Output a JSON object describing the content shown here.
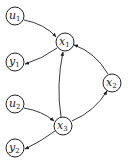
{
  "diagram": {
    "nodes": [
      {
        "id": "u1",
        "label": "u",
        "sub": "1",
        "x": 15,
        "y": 16
      },
      {
        "id": "x1",
        "label": "x",
        "sub": "1",
        "x": 65,
        "y": 42
      },
      {
        "id": "y1",
        "label": "y",
        "sub": "1",
        "x": 15,
        "y": 62
      },
      {
        "id": "x2",
        "label": "x",
        "sub": "2",
        "x": 112,
        "y": 83
      },
      {
        "id": "u2",
        "label": "u",
        "sub": "2",
        "x": 15,
        "y": 104
      },
      {
        "id": "x3",
        "label": "x",
        "sub": "3",
        "x": 63,
        "y": 126
      },
      {
        "id": "y2",
        "label": "y",
        "sub": "2",
        "x": 15,
        "y": 148
      }
    ],
    "edges": [
      {
        "from": "u1",
        "to": "x1"
      },
      {
        "from": "x1",
        "to": "y1"
      },
      {
        "from": "x3",
        "to": "x1"
      },
      {
        "from": "x2",
        "to": "x1"
      },
      {
        "from": "x3",
        "to": "x2"
      },
      {
        "from": "u2",
        "to": "x3"
      },
      {
        "from": "x3",
        "to": "y2"
      }
    ]
  }
}
